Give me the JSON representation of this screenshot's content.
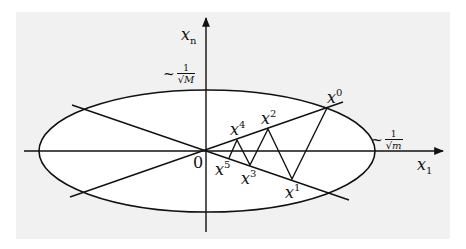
{
  "figure": {
    "background": "#f1f1f1",
    "stroke": "#111111",
    "axes": {
      "horizontal_label_base": "x",
      "horizontal_label_sub": "1",
      "vertical_label_base": "x",
      "vertical_label_sub": "n",
      "origin_label": "0"
    },
    "ellipse_annotations": {
      "minor_axis": {
        "prefix": "~",
        "numerator": "1",
        "radical": "√",
        "denominator": "M"
      },
      "major_axis": {
        "prefix": "~",
        "numerator": "1",
        "radical": "√",
        "denominator": "m"
      }
    },
    "iterates": [
      {
        "base": "x",
        "sup": "0"
      },
      {
        "base": "x",
        "sup": "1"
      },
      {
        "base": "x",
        "sup": "2"
      },
      {
        "base": "x",
        "sup": "3"
      },
      {
        "base": "x",
        "sup": "4"
      },
      {
        "base": "x",
        "sup": "5"
      }
    ]
  }
}
